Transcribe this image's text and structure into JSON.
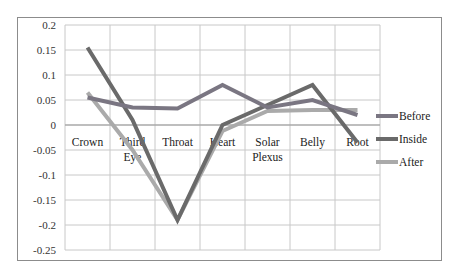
{
  "chart_data": {
    "type": "line",
    "title": "",
    "xlabel": "",
    "ylabel": "",
    "categories": [
      "Crown",
      "Third Eye",
      "Throat",
      "Heart",
      "Solar Plexus",
      "Belly",
      "Root"
    ],
    "series": [
      {
        "name": "Before",
        "color": "#7a7682",
        "values": [
          0.055,
          0.035,
          0.033,
          0.08,
          0.035,
          0.05,
          0.02
        ]
      },
      {
        "name": "Inside",
        "color": "#6a6a6a",
        "values": [
          0.155,
          0.01,
          -0.19,
          0.0,
          0.04,
          0.08,
          -0.035
        ]
      },
      {
        "name": "After",
        "color": "#aaaaaa",
        "values": [
          0.065,
          -0.05,
          -0.19,
          -0.012,
          0.028,
          0.03,
          0.03
        ]
      }
    ],
    "ylim": [
      -0.25,
      0.2
    ],
    "yticks": [
      "0.2",
      "0.15",
      "0.1",
      "0.05",
      "0",
      "-0.05",
      "-0.1",
      "-0.15",
      "-0.2",
      "-0.25"
    ],
    "grid": true,
    "legend_position": "right"
  }
}
